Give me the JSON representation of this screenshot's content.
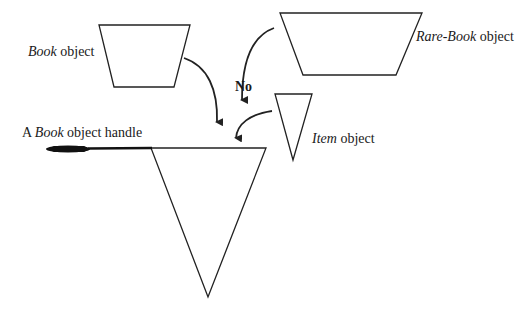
{
  "diagram": {
    "labels": {
      "book_object": {
        "italic": "Book",
        "rest": " object"
      },
      "rare_book_object": {
        "italic": "Rare-Book",
        "rest": " object"
      },
      "item_object": {
        "italic": "Item",
        "rest": " object"
      },
      "handle": {
        "prefix": "A ",
        "italic": "Book",
        "rest": " object handle"
      },
      "no": "No"
    },
    "colors": {
      "stroke": "#222222",
      "background": "#ffffff"
    }
  }
}
